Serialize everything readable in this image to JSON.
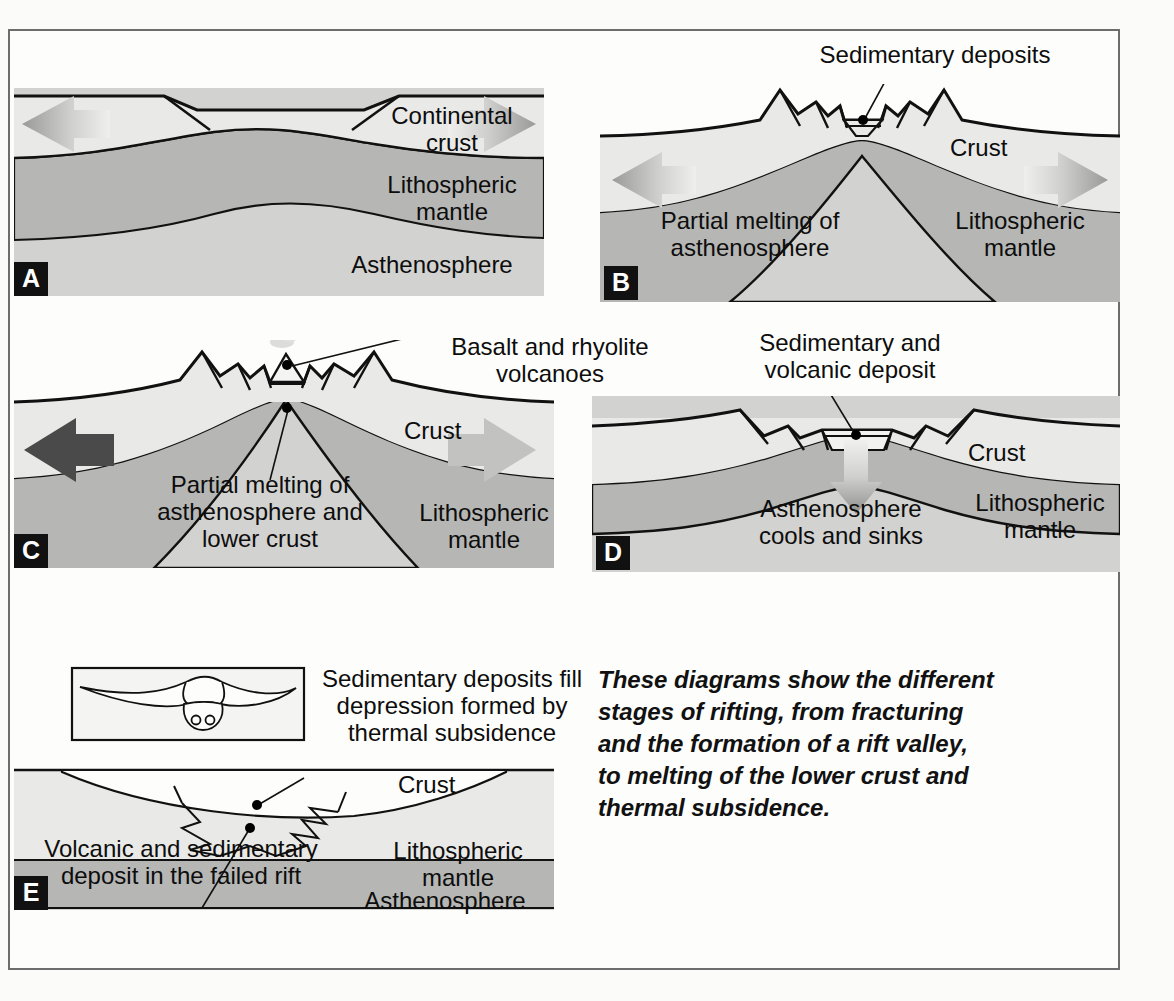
{
  "figure": {
    "caption": "These diagrams show the different\nstages of rifting, from fracturing\nand the formation of a rift valley,\nto melting of the lower crust and\nthermal subsidence."
  },
  "colors": {
    "page_background": "#fbfbfa",
    "frame_border": "#6d6d6d",
    "crust": "#e9e9e7",
    "lithospheric_mantle": "#b6b6b4",
    "asthenosphere": "#d2d2d0",
    "outline": "#111111",
    "panel_letter_background": "#111111",
    "panel_letter_text": "#ffffff",
    "arrow_dark": "#4a4a4a",
    "arrow_light": "#c9c9c9"
  },
  "panels": [
    {
      "id": "A",
      "letter": "A",
      "stage": "Initial doming and fracturing",
      "labels": [
        {
          "name": "continental-crust",
          "text": "Continental\ncrust"
        },
        {
          "name": "lithospheric-mantle",
          "text": "Lithospheric\nmantle"
        },
        {
          "name": "asthenosphere",
          "text": "Asthenosphere"
        }
      ],
      "arrows": [
        {
          "name": "extension-arrow-left",
          "direction": "left",
          "style": "gradient"
        },
        {
          "name": "extension-arrow-right",
          "direction": "right",
          "style": "gradient"
        }
      ]
    },
    {
      "id": "B",
      "letter": "B",
      "stage": "Rift valley with sedimentary fill",
      "labels": [
        {
          "name": "sedimentary-deposits",
          "text": "Sedimentary deposits"
        },
        {
          "name": "crust",
          "text": "Crust"
        },
        {
          "name": "partial-melting",
          "text": "Partial melting of\nasthenosphere"
        },
        {
          "name": "lithospheric-mantle",
          "text": "Lithospheric\nmantle"
        }
      ],
      "arrows": [
        {
          "name": "extension-arrow-left",
          "direction": "left",
          "style": "gradient"
        },
        {
          "name": "extension-arrow-right",
          "direction": "right",
          "style": "gradient"
        }
      ]
    },
    {
      "id": "C",
      "letter": "C",
      "stage": "Volcanism and lower-crust melting",
      "labels": [
        {
          "name": "basalt-rhyolite-volcanoes",
          "text": "Basalt and rhyolite\nvolcanoes"
        },
        {
          "name": "crust",
          "text": "Crust"
        },
        {
          "name": "partial-melting",
          "text": "Partial melting of\nasthenosphere and\nlower crust"
        },
        {
          "name": "lithospheric-mantle",
          "text": "Lithospheric\nmantle"
        }
      ],
      "arrows": [
        {
          "name": "extension-arrow-left",
          "direction": "left",
          "style": "solid-dark"
        },
        {
          "name": "extension-arrow-right",
          "direction": "right",
          "style": "solid-light"
        }
      ]
    },
    {
      "id": "D",
      "letter": "D",
      "stage": "Thermal subsidence begins",
      "labels": [
        {
          "name": "sedimentary-volcanic-deposit",
          "text": "Sedimentary and\nvolcanic deposit"
        },
        {
          "name": "crust",
          "text": "Crust"
        },
        {
          "name": "asthenosphere-cools",
          "text": "Asthenosphere\ncools and sinks"
        },
        {
          "name": "lithospheric-mantle",
          "text": "Lithospheric\nmantle"
        }
      ],
      "arrows": [
        {
          "name": "subsidence-arrow-down",
          "direction": "down",
          "style": "gradient"
        }
      ]
    },
    {
      "id": "E",
      "letter": "E",
      "stage": "Failed rift buried by basin sediments",
      "labels": [
        {
          "name": "sedimentary-deposits-fill",
          "text": "Sedimentary deposits fill\ndepression formed by\nthermal subsidence"
        },
        {
          "name": "volcanic-sedimentary-deposit",
          "text": "Volcanic and sedimentary\ndeposit in the failed rift"
        },
        {
          "name": "crust",
          "text": "Crust"
        },
        {
          "name": "lithospheric-mantle",
          "text": "Lithospheric\nmantle"
        },
        {
          "name": "asthenosphere",
          "text": "Asthenosphere"
        }
      ],
      "inset": {
        "name": "failed-rift-map-inset",
        "description": "plan view of failed rift"
      }
    }
  ]
}
